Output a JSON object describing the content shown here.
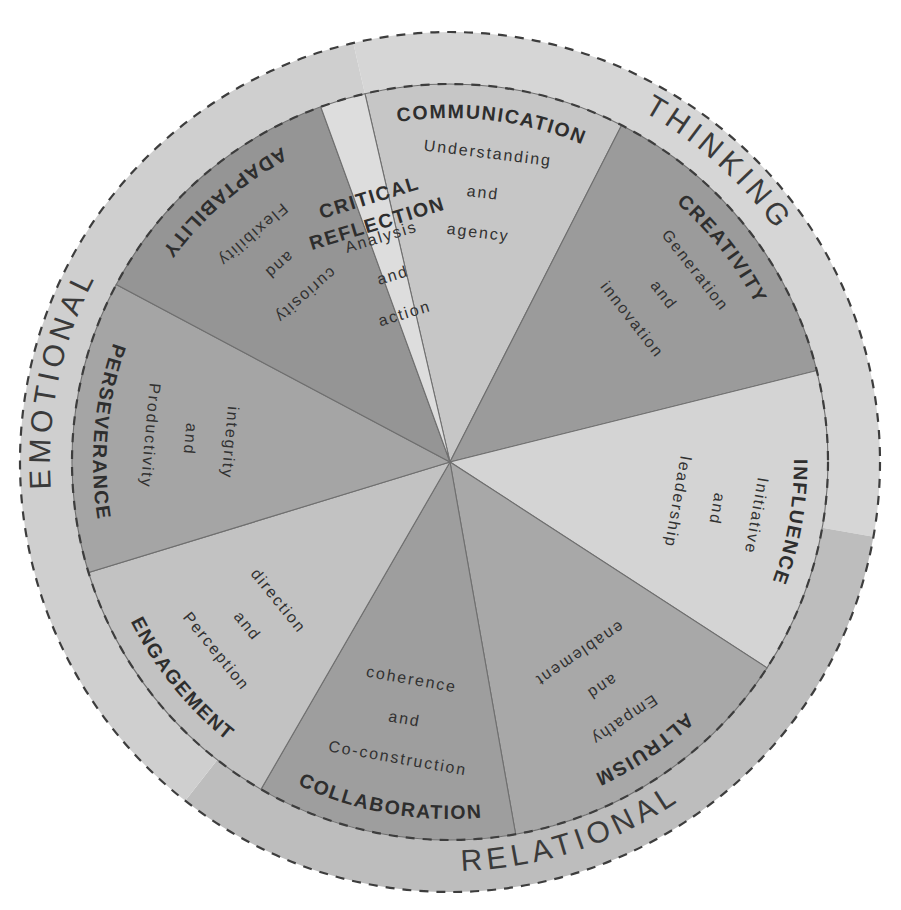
{
  "diagram": {
    "type": "radial-wheel",
    "center": {
      "x": 450,
      "y": 462
    },
    "inner_radius": 0,
    "segment_outer_radius": 378,
    "ring_outer_radius": 430,
    "segment_count": 9,
    "background": "#ffffff"
  },
  "outer_rings": [
    {
      "label": "THINKING",
      "color": "#d6d6d6",
      "start_angle": -103,
      "end_angle": 10,
      "label_angle": -48
    },
    {
      "label": "RELATIONAL",
      "color": "#bdbdbd",
      "start_angle": 10,
      "end_angle": 128,
      "label_angle": 72
    },
    {
      "label": "EMOTIONAL",
      "color": "#cfcfcf",
      "start_angle": 128,
      "end_angle": 257,
      "label_angle": 192
    }
  ],
  "segments": [
    {
      "title": "COMMUNICATION",
      "desc_lines": [
        "Understanding",
        "and",
        "agency"
      ],
      "color": "#c6c6c6",
      "start_angle": -103,
      "end_angle": -63,
      "mid_angle": -83,
      "flip": false
    },
    {
      "title": "CREATIVITY",
      "desc_lines": [
        "Generation",
        "and",
        "innovation"
      ],
      "color": "#9b9b9b",
      "start_angle": -63,
      "end_angle": -14,
      "mid_angle": -38,
      "flip": false
    },
    {
      "title": "INFLUENCE",
      "desc_lines": [
        "Initiative",
        "and",
        "leadership"
      ],
      "color": "#d4d4d4",
      "start_angle": -14,
      "end_angle": 33,
      "mid_angle": 10,
      "flip": false
    },
    {
      "title": "ALTRUISM",
      "desc_lines": [
        "Empathy",
        "and",
        "enablement"
      ],
      "color": "#a8a8a8",
      "start_angle": 33,
      "end_angle": 80,
      "mid_angle": 56,
      "flip": false
    },
    {
      "title": "COLLABORATION",
      "desc_lines": [
        "Co-construction",
        "and",
        "coherence"
      ],
      "color": "#9e9e9e",
      "start_angle": 80,
      "end_angle": 120,
      "mid_angle": 100,
      "flip": true
    },
    {
      "title": "ENGAGEMENT",
      "desc_lines": [
        "Perception",
        "and",
        "direction"
      ],
      "color": "#c2c2c2",
      "start_angle": 120,
      "end_angle": 163,
      "mid_angle": 141,
      "flip": true
    },
    {
      "title": "PERSEVERANCE",
      "desc_lines": [
        "Productivity",
        "and",
        "integrity"
      ],
      "color": "#a5a5a5",
      "start_angle": 163,
      "end_angle": 208,
      "mid_angle": 185,
      "flip": true
    },
    {
      "title": "ADAPTABILITY",
      "desc_lines": [
        "Flexibility",
        "and",
        "curiosity"
      ],
      "color": "#959595",
      "start_angle": 208,
      "end_angle": 250,
      "mid_angle": 229,
      "flip": true
    },
    {
      "title": "CRITICAL REFLECTION",
      "desc_lines": [
        "Analysis",
        "and",
        "action"
      ],
      "color": "#dddddd",
      "start_angle": 250,
      "end_angle": 257,
      "mid_angle": 253,
      "flip": false
    }
  ],
  "chart_data": {
    "type": "pie",
    "title": "",
    "categories": [
      "COMMUNICATION",
      "CREATIVITY",
      "INFLUENCE",
      "ALTRUISM",
      "COLLABORATION",
      "ENGAGEMENT",
      "PERSEVERANCE",
      "ADAPTABILITY",
      "CRITICAL REFLECTION"
    ],
    "values": [
      40,
      49,
      47,
      47,
      40,
      43,
      45,
      42,
      47
    ],
    "value_unit": "degrees",
    "groups": [
      "THINKING",
      "RELATIONAL",
      "EMOTIONAL"
    ],
    "legend_position": "outer-ring"
  }
}
